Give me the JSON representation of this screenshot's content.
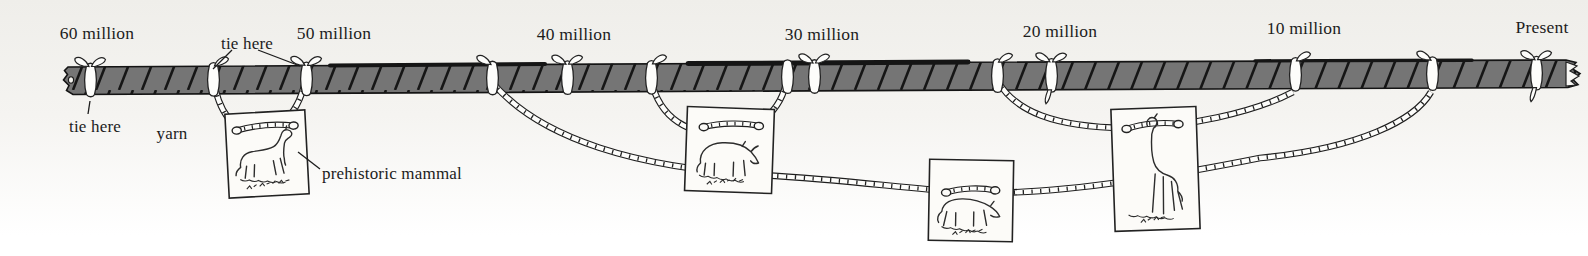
{
  "figure": {
    "colors": {
      "background": "#f2f1ed",
      "ink": "#1c1c1c",
      "rope_fill": "#757575",
      "yarn_white": "#fdfdfb",
      "card_paper": "#fcfbf8"
    }
  },
  "timeline": {
    "ticks": [
      {
        "label": "60 million"
      },
      {
        "label": "50 million"
      },
      {
        "label": "40 million"
      },
      {
        "label": "30 million"
      },
      {
        "label": "20 million"
      },
      {
        "label": "10 million"
      },
      {
        "label": "Present"
      }
    ]
  },
  "labels": {
    "tie_here_top": "tie here",
    "tie_here_start": "tie here",
    "yarn": "yarn",
    "prehistoric_mammal": "prehistoric mammal"
  },
  "cards": [
    {
      "subject": "small horse-like prehistoric mammal card",
      "caption": "HYRACOTHERIUM (handwritten, partly legible)"
    },
    {
      "subject": "rhinoceros-like prehistoric mammal card",
      "caption": "(illegible handwritten name)"
    },
    {
      "subject": "bear-dog-like prehistoric mammal card",
      "caption": "(illegible handwritten name)"
    },
    {
      "subject": "long-necked camel-like prehistoric mammal card",
      "caption": "(illegible handwritten name)"
    }
  ]
}
